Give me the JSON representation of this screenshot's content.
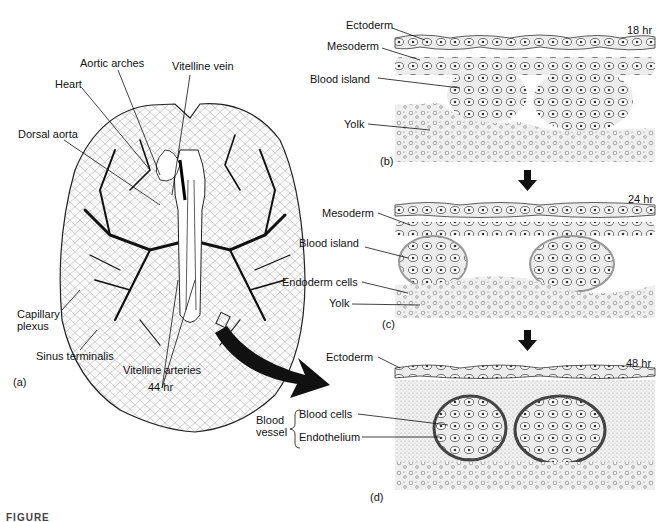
{
  "figure": {
    "caption_fragment": "FIGURE"
  },
  "panel_a": {
    "tag": "(a)",
    "stage": "44 hr",
    "labels": {
      "aortic_arches": "Aortic arches",
      "vitelline_vein": "Vitelline vein",
      "heart": "Heart",
      "dorsal_aorta": "Dorsal aorta",
      "capillary_plexus_1": "Capillary",
      "capillary_plexus_2": "plexus",
      "sinus_terminalis": "Sinus terminalis",
      "vitelline_arteries": "Vitelline arteries"
    }
  },
  "panel_b": {
    "tag": "(b)",
    "stage": "18 hr",
    "labels": {
      "ectoderm": "Ectoderm",
      "mesoderm": "Mesoderm",
      "blood_island": "Blood island",
      "yolk": "Yolk"
    }
  },
  "panel_c": {
    "tag": "(c)",
    "stage": "24 hr",
    "labels": {
      "mesoderm": "Mesoderm",
      "blood_island": "Blood island",
      "endoderm_cells": "Endoderm cells",
      "yolk": "Yolk"
    }
  },
  "panel_d": {
    "tag": "(d)",
    "stage": "48 hr",
    "labels": {
      "ectoderm": "Ectoderm",
      "blood_vessel_1": "Blood",
      "blood_vessel_2": "vessel",
      "blood_cells": "Blood cells",
      "endothelium": "Endothelium"
    }
  },
  "colors": {
    "ink": "#111111",
    "stipple": "#bdbdbd",
    "tissue": "#e6e6e6"
  }
}
